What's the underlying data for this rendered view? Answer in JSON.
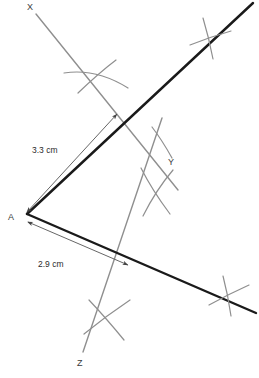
{
  "diagram": {
    "canvas": {
      "width": 259,
      "height": 378,
      "background": "#ffffff"
    },
    "colors": {
      "ray_stroke": "#1a1a1a",
      "construction_stroke": "#8a8a8a",
      "dimension_stroke": "#555555",
      "label_text": "#3a3a3a"
    },
    "labels": {
      "vertex_a": "A",
      "point_x": "X",
      "point_y": "Y",
      "point_z": "Z"
    },
    "dimensions": {
      "upper": "3.3 cm",
      "lower": "2.9 cm"
    },
    "label_positions": {
      "vertex_a": {
        "x": 10,
        "y": 219
      },
      "point_x": {
        "x": 27,
        "y": 9
      },
      "point_y": {
        "x": 168,
        "y": 164
      },
      "point_z": {
        "x": 78,
        "y": 365
      },
      "upper_dim": {
        "x": 33,
        "y": 152
      },
      "lower_dim": {
        "x": 39,
        "y": 266
      }
    },
    "geometry": {
      "vertex": {
        "x": 27,
        "y": 214
      },
      "upper_ray_end": {
        "x": 253,
        "y": 3
      },
      "lower_ray_end": {
        "x": 256,
        "y": 313
      },
      "construction_line_x": {
        "x1": 36,
        "y1": 14,
        "x2": 175,
        "y2": 186
      },
      "construction_line_z": {
        "x1": 161,
        "y1": 120,
        "x2": 84,
        "y2": 352
      },
      "upper_dim_arrow": {
        "x1": 25,
        "y1": 216,
        "x2": 119,
        "y2": 113
      },
      "lower_dim_arrow": {
        "x1": 26,
        "y1": 222,
        "x2": 129,
        "y2": 265
      }
    },
    "arc_marks": [
      {
        "name": "arc-on-ray-ax",
        "cx": 96,
        "cy": 77
      },
      {
        "name": "arc-upper-ray",
        "cx": 209,
        "cy": 37
      },
      {
        "name": "arc-near-y",
        "cx": 155,
        "cy": 190
      },
      {
        "name": "arc-on-line-z",
        "cx": 105,
        "cy": 318
      },
      {
        "name": "arc-lower-ray",
        "cx": 228,
        "cy": 294
      }
    ]
  }
}
